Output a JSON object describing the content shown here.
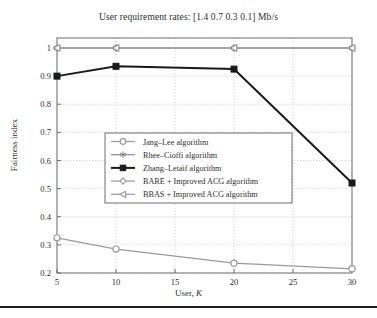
{
  "figure": {
    "title": "User requirement rates: [1.4 0.7 0.3 0.1] Mb/s",
    "ylabel": "Fairness index",
    "xlabel_prefix": "User, ",
    "xlabel_symbol": "K",
    "background": "#ffffff",
    "axis_color": "#6e6e6e",
    "grid_color": "#b0b0b0"
  },
  "axes": {
    "x_ticks": [
      "5",
      "10",
      "15",
      "20",
      "25",
      "30"
    ],
    "y_ticks": [
      "0.2",
      "0.3",
      "0.4",
      "0.5",
      "0.6",
      "0.7",
      "0.8",
      "0.9",
      "1"
    ]
  },
  "legend": {
    "items": [
      {
        "label": "Jang–Lee algorithm",
        "marker": "circle-icon",
        "color": "#9a9a9a"
      },
      {
        "label": "Rhee–Cioffi algorithm",
        "marker": "asterisk-icon",
        "color": "#8e8e8e"
      },
      {
        "label": "Zhang–Letaif algorithm",
        "marker": "filled-square-icon",
        "color": "#1a1a1a"
      },
      {
        "label": "BARE + Improved ACG algorithm",
        "marker": "diamond-icon",
        "color": "#9a9a9a"
      },
      {
        "label": "BBAS + Improved ACG algorithm",
        "marker": "left-triangle-icon",
        "color": "#9a9a9a"
      }
    ]
  },
  "chart_data": {
    "type": "line",
    "title": "User requirement rates: [1.4 0.7 0.3 0.1] Mb/s",
    "xlabel": "User, K",
    "ylabel": "Fairness index",
    "x": [
      5,
      10,
      20,
      30
    ],
    "xlim": [
      5,
      30
    ],
    "ylim": [
      0.2,
      1.0
    ],
    "grid": true,
    "legend_position": "center-left",
    "series": [
      {
        "name": "Jang–Lee algorithm",
        "values": [
          0.325,
          0.285,
          0.235,
          0.215
        ],
        "marker": "circle",
        "color": "#9a9a9a"
      },
      {
        "name": "Rhee–Cioffi algorithm",
        "values": [
          1.0,
          1.0,
          1.0,
          1.0
        ],
        "marker": "asterisk",
        "color": "#8e8e8e"
      },
      {
        "name": "Zhang–Letaif algorithm",
        "values": [
          0.9,
          0.935,
          0.925,
          0.52
        ],
        "marker": "filled-square",
        "color": "#1a1a1a"
      },
      {
        "name": "BARE + Improved ACG algorithm",
        "values": [
          1.0,
          1.0,
          1.0,
          1.0
        ],
        "marker": "diamond",
        "color": "#9a9a9a"
      },
      {
        "name": "BBAS + Improved ACG algorithm",
        "values": [
          1.0,
          1.0,
          1.0,
          1.0
        ],
        "marker": "left-triangle",
        "color": "#9a9a9a"
      }
    ]
  }
}
